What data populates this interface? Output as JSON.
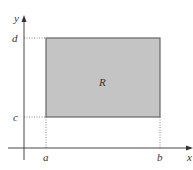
{
  "diagram": {
    "type": "rectangle-region-on-axes",
    "region_label": "R",
    "axes": {
      "x_label": "x",
      "y_label": "y"
    },
    "x_ticks": [
      {
        "label": "a",
        "x": 46
      },
      {
        "label": "b",
        "x": 160
      }
    ],
    "y_ticks": [
      {
        "label": "d",
        "y": 38
      },
      {
        "label": "c",
        "y": 117
      }
    ],
    "colors": {
      "fill": "#c4c4c4",
      "border": "#666666",
      "axis": "#333333",
      "guide": "#888888"
    }
  }
}
